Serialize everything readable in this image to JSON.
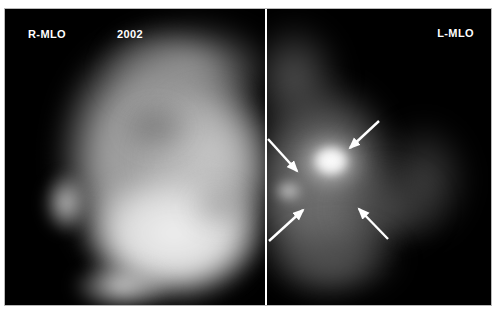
{
  "panels": {
    "left": {
      "label": "R-MLO",
      "year": "2002"
    },
    "right": {
      "label": "L-MLO"
    }
  },
  "annotations": {
    "arrow_color": "#ffffff",
    "arrows": [
      {
        "x1": 374,
        "y1": 112,
        "x2": 345,
        "y2": 139,
        "direction": "down-left"
      },
      {
        "x1": 263,
        "y1": 130,
        "x2": 292,
        "y2": 162,
        "direction": "down-right"
      },
      {
        "x1": 264,
        "y1": 232,
        "x2": 298,
        "y2": 201,
        "direction": "up-right"
      },
      {
        "x1": 383,
        "y1": 230,
        "x2": 354,
        "y2": 200,
        "direction": "up-left"
      }
    ]
  },
  "colors": {
    "background": "#ffffff",
    "panel_background": "#000000",
    "divider": "#ffffff",
    "label_text": "#ffffff",
    "frame_border": "#b9b9b9"
  }
}
